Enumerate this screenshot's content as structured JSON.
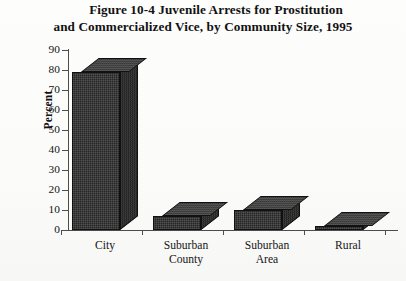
{
  "figure": {
    "title_line1": "Figure 10-4  Juvenile Arrests for Prostitution",
    "title_line2": "and Commercialized Vice, by Community Size, 1995"
  },
  "chart_data": {
    "type": "bar",
    "title": "Figure 10-4  Juvenile Arrests for Prostitution and Commercialized Vice, by Community Size, 1995",
    "xlabel": "",
    "ylabel": "Percent",
    "ylim": [
      0,
      90
    ],
    "ytick_values": [
      0,
      10,
      20,
      30,
      40,
      50,
      60,
      70,
      80,
      90
    ],
    "ytick_labels": [
      "0",
      "10",
      "20",
      "30",
      "40",
      "50",
      "60",
      "70",
      "80",
      "90"
    ],
    "grid": false,
    "legend": "none",
    "three_d": true,
    "bar_color": "#262626",
    "categories": [
      "City",
      "Suburban County",
      "Suburban Area",
      "Rural"
    ],
    "category_lines": [
      [
        "City"
      ],
      [
        "Suburban",
        "County"
      ],
      [
        "Suburban",
        "Area"
      ],
      [
        "Rural"
      ]
    ],
    "values": [
      79,
      7,
      10,
      2
    ]
  }
}
